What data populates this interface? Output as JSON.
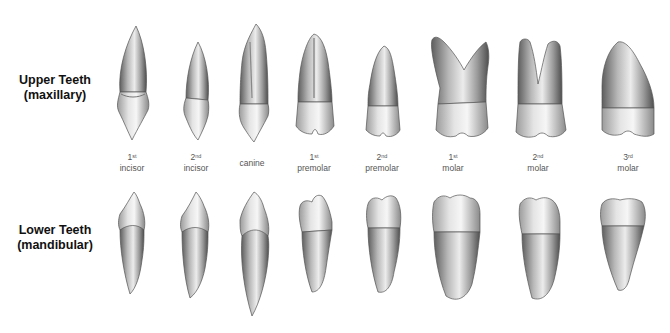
{
  "figure": {
    "rows": [
      {
        "id": "upper",
        "line1": "Upper Teeth",
        "line2": "(maxillary)"
      },
      {
        "id": "lower",
        "line1": "Lower Teeth",
        "line2": "(mandibular)"
      }
    ],
    "teeth": [
      {
        "ordinal": "1",
        "suffix": "st",
        "name": "incisor",
        "x": 132
      },
      {
        "ordinal": "2",
        "suffix": "nd",
        "name": "incisor",
        "x": 196
      },
      {
        "ordinal": "",
        "suffix": "",
        "name": "canine",
        "x": 252
      },
      {
        "ordinal": "1",
        "suffix": "st",
        "name": "premolar",
        "x": 314
      },
      {
        "ordinal": "2",
        "suffix": "nd",
        "name": "premolar",
        "x": 382
      },
      {
        "ordinal": "1",
        "suffix": "st",
        "name": "molar",
        "x": 453
      },
      {
        "ordinal": "2",
        "suffix": "nd",
        "name": "molar",
        "x": 538
      },
      {
        "ordinal": "3",
        "suffix": "rd",
        "name": "molar",
        "x": 628
      }
    ],
    "colors": {
      "background": "#ffffff",
      "enamel_light": "#f2f2f2",
      "enamel_mid": "#bdbdbd",
      "shadow": "#6e6e6e",
      "outline": "#555555",
      "label_text": "#555555",
      "row_label_text": "#111111"
    }
  }
}
